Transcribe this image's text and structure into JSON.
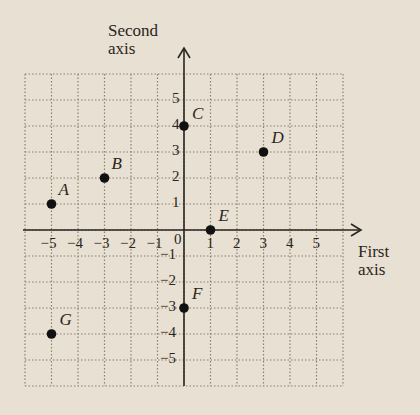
{
  "chart_data": {
    "type": "scatter",
    "title": "",
    "xlabel": "First axis",
    "ylabel": "Second axis",
    "xlabel_lines": [
      "First",
      "axis"
    ],
    "ylabel_lines": [
      "Second",
      "axis"
    ],
    "xlim": [
      -6,
      6
    ],
    "ylim": [
      -6,
      6
    ],
    "grid": true,
    "grid_style": "dotted",
    "x_ticks": [
      -5,
      -4,
      -3,
      -2,
      -1,
      1,
      2,
      3,
      4,
      5
    ],
    "y_ticks": [
      -5,
      -4,
      -3,
      -2,
      -1,
      1,
      2,
      3,
      4,
      5
    ],
    "origin_label": "0",
    "points": [
      {
        "label": "A",
        "x": -5,
        "y": 1
      },
      {
        "label": "B",
        "x": -3,
        "y": 2
      },
      {
        "label": "C",
        "x": 0,
        "y": 4
      },
      {
        "label": "D",
        "x": 3,
        "y": 3
      },
      {
        "label": "E",
        "x": 1,
        "y": 0
      },
      {
        "label": "F",
        "x": 0,
        "y": -3
      },
      {
        "label": "G",
        "x": -5,
        "y": -4
      }
    ]
  },
  "colors": {
    "background": "#e8e0d2",
    "grid": "#8a8070",
    "axis": "#2b2520",
    "point": "#111111"
  }
}
